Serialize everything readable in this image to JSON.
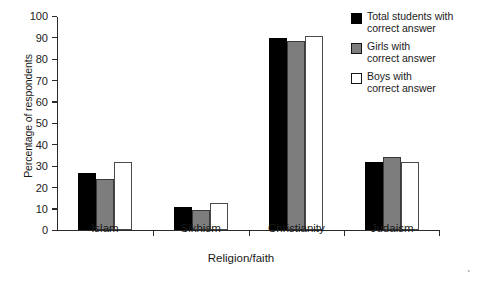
{
  "chart_data": {
    "type": "bar",
    "title": "",
    "xlabel": "Religion/faith",
    "ylabel": "Percentage of respondents",
    "categories": [
      "Islam",
      "Sikhism",
      "Christianity",
      "Judaism"
    ],
    "series": [
      {
        "name": "Total students with correct answer",
        "color": "#000000",
        "values": [
          26.5,
          10.5,
          89.5,
          31.5
        ]
      },
      {
        "name": "Girls with correct answer",
        "color": "#7d7d7d",
        "values": [
          23.5,
          9,
          88,
          34
        ]
      },
      {
        "name": "Boys with correct answer",
        "color": "#ffffff",
        "values": [
          31.5,
          12.5,
          90.5,
          31.5
        ]
      }
    ],
    "ylim": [
      0,
      100
    ],
    "yticks": [
      0,
      10,
      20,
      30,
      40,
      50,
      60,
      70,
      80,
      90,
      100
    ],
    "grid": false,
    "legend_position": "top-right"
  },
  "legend": {
    "entries": [
      {
        "line1": "Total students with",
        "line2": "correct answer"
      },
      {
        "line1": "Girls with",
        "line2": "correct answer"
      },
      {
        "line1": "Boys with",
        "line2": "correct answer"
      }
    ]
  }
}
